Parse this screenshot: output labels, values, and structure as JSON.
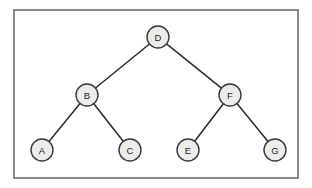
{
  "diagram": {
    "type": "binary-tree",
    "title": "",
    "canvas": {
      "width": 312,
      "height": 188,
      "background": "#ffffff"
    },
    "frame": {
      "x": 14,
      "y": 10,
      "width": 284,
      "height": 168,
      "stroke": "#6e6e6e",
      "stroke_width": 1.6,
      "fill": "#ffffff"
    },
    "style": {
      "node_fill": "#ececeb",
      "node_stroke": "#3a3a3a",
      "node_stroke_width": 1.4,
      "node_radius": 11,
      "label_color": "#1c1c1c",
      "edge_stroke": "#2b2b2b",
      "edge_stroke_width": 1.5
    },
    "nodes": [
      {
        "id": "D",
        "label": "D",
        "x": 158,
        "y": 37,
        "level": 0,
        "role": "root"
      },
      {
        "id": "B",
        "label": "B",
        "x": 87,
        "y": 95,
        "level": 1,
        "role": "internal"
      },
      {
        "id": "F",
        "label": "F",
        "x": 230,
        "y": 95,
        "level": 1,
        "role": "internal"
      },
      {
        "id": "A",
        "label": "A",
        "x": 42,
        "y": 150,
        "level": 2,
        "role": "leaf"
      },
      {
        "id": "C",
        "label": "C",
        "x": 130,
        "y": 150,
        "level": 2,
        "role": "leaf"
      },
      {
        "id": "E",
        "label": "E",
        "x": 188,
        "y": 150,
        "level": 2,
        "role": "leaf"
      },
      {
        "id": "G",
        "label": "G",
        "x": 275,
        "y": 150,
        "level": 2,
        "role": "leaf"
      }
    ],
    "edges": [
      {
        "from": "D",
        "to": "B",
        "side": "left"
      },
      {
        "from": "D",
        "to": "F",
        "side": "right"
      },
      {
        "from": "B",
        "to": "A",
        "side": "left"
      },
      {
        "from": "B",
        "to": "C",
        "side": "right"
      },
      {
        "from": "F",
        "to": "E",
        "side": "left"
      },
      {
        "from": "F",
        "to": "G",
        "side": "right"
      }
    ]
  }
}
